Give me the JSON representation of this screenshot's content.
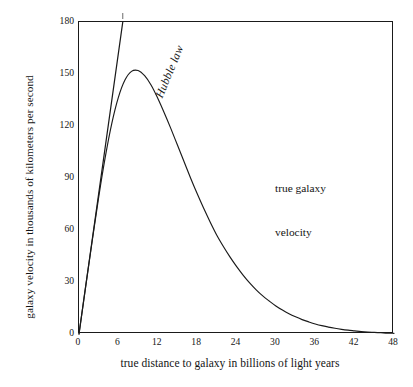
{
  "chart_data": {
    "type": "line",
    "title": "",
    "xlabel": "true distance to galaxy in billions of light years",
    "ylabel": "galaxy velocity in thousands of kilometers per second",
    "xlim": [
      0,
      48
    ],
    "ylim": [
      0,
      180
    ],
    "xticks": [
      "0",
      "6",
      "12",
      "18",
      "24",
      "30",
      "36",
      "42",
      "48"
    ],
    "yticks": [
      "0",
      "30",
      "60",
      "90",
      "120",
      "150",
      "180"
    ],
    "xtick_values": [
      0,
      6,
      12,
      18,
      24,
      30,
      36,
      42,
      48
    ],
    "ytick_values": [
      0,
      30,
      60,
      90,
      120,
      150,
      180
    ],
    "grid": false,
    "legend_position": "inline-annotations",
    "annotations": [
      {
        "name": "hubble-law",
        "text": "Hubble law",
        "style": "italic",
        "x": 3.0,
        "y": 112
      },
      {
        "name": "true-galaxy-velocity",
        "text": "true galaxy\nvelocity",
        "style": "normal",
        "x": 21.5,
        "y": 118
      }
    ],
    "series": [
      {
        "name": "Hubble law",
        "type": "line",
        "note": "straight line through origin, slope 27 (thousand km/s per billion ly); exits top of frame at x = 6.67",
        "slope": 27.0,
        "x": [
          0,
          6.67
        ],
        "values": [
          0,
          180
        ]
      },
      {
        "name": "true galaxy velocity",
        "type": "curve",
        "peak_x": 9.0,
        "peak_y": 152,
        "x": [
          0,
          1,
          2,
          3,
          4,
          5,
          6,
          7,
          8,
          9,
          10,
          11,
          12,
          13,
          14,
          15,
          16,
          17,
          18,
          19,
          20,
          21,
          22,
          23,
          24,
          25,
          26,
          27,
          28,
          29,
          30,
          31,
          32,
          33,
          34,
          35,
          36,
          37,
          38,
          39,
          40,
          41,
          42,
          43,
          44,
          45,
          46,
          47,
          48
        ],
        "values": [
          0,
          27,
          53.5,
          79,
          102,
          121.5,
          136.5,
          146.5,
          151.5,
          152,
          149,
          143.5,
          136,
          127.5,
          118.5,
          109,
          99.5,
          90,
          81,
          72.5,
          64.5,
          57,
          50.5,
          44.5,
          39,
          34,
          29.5,
          25.5,
          22,
          19,
          16.2,
          13.8,
          11.7,
          9.9,
          8.3,
          7.0,
          5.8,
          4.8,
          4.0,
          3.3,
          2.7,
          2.2,
          1.8,
          1.4,
          1.1,
          0.9,
          0.7,
          0.5,
          0.4
        ]
      }
    ]
  },
  "axis": {
    "ylabel": "galaxy velocity in thousands of kilometers per second",
    "xlabel": "true distance to galaxy in billions of light years"
  },
  "labels": {
    "hubble": "Hubble law",
    "curve_line1": "true galaxy",
    "curve_line2": "velocity"
  },
  "colors": {
    "line": "#1a1a1a",
    "frame": "#1a1a1a",
    "background": "#ffffff",
    "text": "#141414"
  }
}
